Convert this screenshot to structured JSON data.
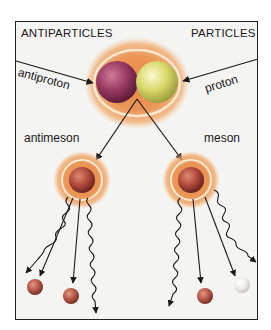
{
  "diagram": {
    "headers": {
      "left": "ANTIPARTICLES",
      "right": "PARTICLES"
    },
    "labels": {
      "antiproton": "antiproton",
      "proton": "proton",
      "antimeson": "antimeson",
      "meson": "meson"
    },
    "colors": {
      "halo": "#e8823a",
      "halo_edge": "#f0a868",
      "antiproton": "#9a3a62",
      "proton": "#d8d86a",
      "meson_core": "#b04a3c",
      "decay_red": "#b8584a",
      "decay_white": "#ececea",
      "line": "#1a1a1a",
      "background": "#f4f4f2"
    },
    "nodes": [
      {
        "id": "annihilation",
        "label": "antiproton + proton",
        "x": 137,
        "y": 82
      },
      {
        "id": "antimeson",
        "label": "antimeson",
        "x": 82,
        "y": 183
      },
      {
        "id": "meson",
        "label": "meson",
        "x": 190,
        "y": 183
      }
    ],
    "edges": [
      {
        "from": "antiproton-label",
        "to": "antiproton"
      },
      {
        "from": "proton-label",
        "to": "proton"
      },
      {
        "from": "annihilation",
        "to": "antimeson"
      },
      {
        "from": "annihilation",
        "to": "meson"
      },
      {
        "from": "antimeson",
        "to": "decay-particle-1"
      },
      {
        "from": "antimeson",
        "to": "decay-particle-2"
      },
      {
        "from": "meson",
        "to": "decay-particle-3"
      },
      {
        "from": "meson",
        "to": "decay-particle-4"
      }
    ]
  }
}
